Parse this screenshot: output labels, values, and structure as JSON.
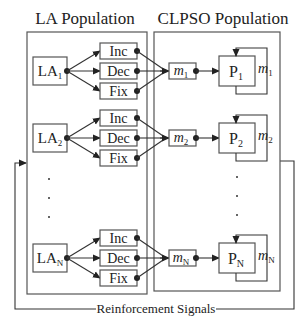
{
  "titles": {
    "la_population": "LA Population",
    "clpso_population": "CLPSO Population"
  },
  "feedback_label": "Reinforcement Signals",
  "actions": [
    "Inc",
    "Dec",
    "Fix"
  ],
  "ellipsis": "·",
  "rows": [
    {
      "la": {
        "base": "LA",
        "sub": "1"
      },
      "m": {
        "base": "m",
        "sub": "1"
      },
      "p": {
        "base": "P",
        "sub": "1"
      },
      "loop": {
        "base": "m",
        "sub": "1"
      }
    },
    {
      "la": {
        "base": "LA",
        "sub": "2"
      },
      "m": {
        "base": "m",
        "sub": "2"
      },
      "p": {
        "base": "P",
        "sub": "2"
      },
      "loop": {
        "base": "m",
        "sub": "2"
      }
    },
    {
      "la": {
        "base": "LA",
        "sub": "N"
      },
      "m": {
        "base": "m",
        "sub": "N"
      },
      "p": {
        "base": "P",
        "sub": "N"
      },
      "loop": {
        "base": "m",
        "sub": "N"
      }
    }
  ],
  "colors": {
    "line": "#333333",
    "box_stroke": "#555555",
    "background": "#ffffff",
    "text": "#222222"
  }
}
